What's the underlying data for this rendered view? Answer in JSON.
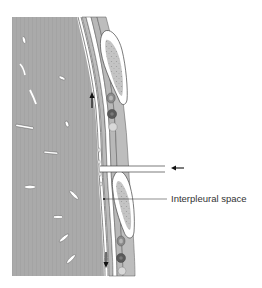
{
  "diagram": {
    "labels": {
      "interpleural_space": "Interpleural space"
    },
    "annotations": {
      "arrow_up": "flow-up-arrow",
      "arrow_down": "flow-down-arrow",
      "arrow_left": "insertion-arrow"
    },
    "colors": {
      "lung_tissue": "#aaaaaa",
      "pleura_band": "#b4b4b4",
      "outline": "#444444",
      "background": "#ffffff",
      "cell_fill": "#c8c8c8",
      "cell_dark": "#5a5a5a",
      "cell_medium": "#8a8a8a",
      "cell_light": "#d8d8d8",
      "label_text": "#333333"
    }
  }
}
